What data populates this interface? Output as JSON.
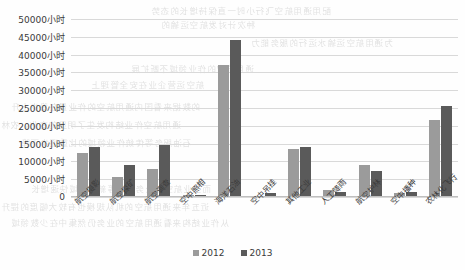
{
  "chart_data": {
    "type": "bar",
    "title": "",
    "xlabel": "",
    "ylabel": "",
    "ylim": [
      0,
      50000
    ],
    "ytick_step": 5000,
    "grid": true,
    "legend_position": "bottom",
    "unit_suffix": "小时",
    "categories": [
      "航空摄影",
      "航空探矿",
      "航空调查",
      "空中照相",
      "海洋石油",
      "空中吊挂",
      "其他工业",
      "人工降雨",
      "航空护林",
      "空中播种",
      "农林化飞行"
    ],
    "ytick_labels": [
      "50000小时",
      "45000小时",
      "40000小时",
      "35000小时",
      "30000小时",
      "25000小时",
      "20000小时",
      "15000小时",
      "10000小时",
      "5000小时",
      "0"
    ],
    "ytick_values": [
      50000,
      45000,
      40000,
      35000,
      30000,
      25000,
      20000,
      15000,
      10000,
      5000,
      0
    ],
    "series": [
      {
        "name": "2012",
        "color": "#9b9b9b",
        "values": [
          12500,
          5700,
          7800,
          600,
          37000,
          400,
          13500,
          1900,
          9000,
          1200,
          21500
        ]
      },
      {
        "name": "2013",
        "color": "#5a5a5a",
        "values": [
          14000,
          9000,
          14500,
          700,
          44000,
          1200,
          14000,
          1500,
          7200,
          1400,
          25500
        ]
      }
    ]
  },
  "background_bleed": [
    "配用通用航空飞行小时一直保持增长的态势",
    "种次计对发航空运输的",
    "为通用航空运输水运行的服务能力",
    "通用航空的作业领域不断扩展",
    "航空运营企业在安全管理上",
    "的数据来看国内通用航空的作业量在稳步上升",
    "通用航空作业结构发生了明显的变化，农林",
    "石油服务等传统作业领域的比重逐步下降",
    "而工业航空和公务飞行等新兴领域快速增长",
    "近五年来通用航空的机队规模也有较大幅度的提升",
    "从作业结构来看通用航空的业务仍然集中在少数领域"
  ]
}
